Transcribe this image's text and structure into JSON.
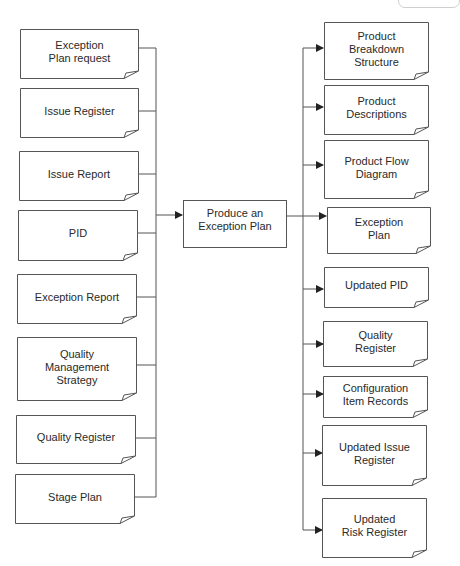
{
  "diagram": {
    "type": "process-flow",
    "colors": {
      "line": "#555555",
      "text": "#2a2a2a",
      "background": "#ffffff"
    },
    "process": {
      "label": "Produce an Exception Plan"
    },
    "inputs": [
      {
        "label": "Exception Plan request",
        "lines": [
          "Exception",
          "Plan request"
        ]
      },
      {
        "label": "Issue Register",
        "lines": [
          "Issue Register"
        ]
      },
      {
        "label": "Issue Report",
        "lines": [
          "Issue Report"
        ]
      },
      {
        "label": "PID",
        "lines": [
          "PID"
        ]
      },
      {
        "label": "Exception Report",
        "lines": [
          "Exception Report"
        ]
      },
      {
        "label": "Quality Management Strategy",
        "lines": [
          "Quality",
          "Management",
          "Strategy"
        ]
      },
      {
        "label": "Quality Register",
        "lines": [
          "Quality Register"
        ]
      },
      {
        "label": "Stage Plan",
        "lines": [
          "Stage Plan"
        ]
      }
    ],
    "outputs": [
      {
        "label": "Product Breakdown Structure",
        "lines": [
          "Product",
          "Breakdown",
          "Structure"
        ]
      },
      {
        "label": "Product Descriptions",
        "lines": [
          "Product",
          "Descriptions"
        ]
      },
      {
        "label": "Product Flow Diagram",
        "lines": [
          "Product Flow",
          "Diagram"
        ]
      },
      {
        "label": "Exception Plan",
        "lines": [
          "Exception",
          "Plan"
        ]
      },
      {
        "label": "Updated PID",
        "lines": [
          "Updated PID"
        ]
      },
      {
        "label": "Quality Register",
        "lines": [
          "Quality",
          "Register"
        ]
      },
      {
        "label": "Configuration Item Records",
        "lines": [
          "Configuration",
          "Item Records"
        ]
      },
      {
        "label": "Updated Issue Register",
        "lines": [
          "Updated Issue",
          "Register"
        ]
      },
      {
        "label": "Updated Risk Register",
        "lines": [
          "Updated",
          "Risk Register"
        ]
      }
    ]
  }
}
